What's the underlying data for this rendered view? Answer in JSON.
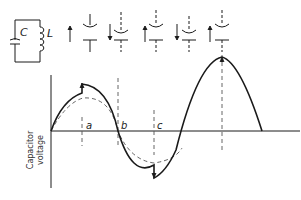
{
  "circuit": {
    "capacitor_label": "C",
    "inductor_label": "L"
  },
  "axis": {
    "ylabel_line1": "Capacitor",
    "ylabel_line2": "voltage"
  },
  "markers": [
    {
      "label": "a"
    },
    {
      "label": "b"
    },
    {
      "label": "c"
    }
  ],
  "colors": {
    "ink": "#1a1a1a",
    "dashed": "#555555",
    "background": "#ffffff"
  }
}
